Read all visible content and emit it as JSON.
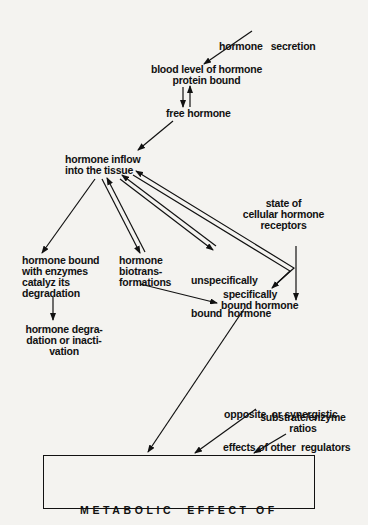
{
  "diagram": {
    "nodes": {
      "secretion": {
        "lines": [
          "hormone   secretion"
        ]
      },
      "blood_level": {
        "lines": [
          "blood level of hormone",
          "protein bound"
        ]
      },
      "free": {
        "lines": [
          "free hormone"
        ]
      },
      "inflow": {
        "lines": [
          "hormone inflow",
          "into the tissue"
        ]
      },
      "enzymes": {
        "lines": [
          "hormone bound",
          "with enzymes",
          "catalyz its",
          "degradation"
        ]
      },
      "biotrans": {
        "lines": [
          "hormone",
          "biotrans-",
          "formations"
        ]
      },
      "unspecific": {
        "lines": [
          "unspecifically",
          "bound  hormone"
        ]
      },
      "receptors": {
        "lines": [
          "state of",
          "cellular hormone",
          "receptors"
        ]
      },
      "specific": {
        "lines": [
          "specifically",
          "bound hormone"
        ]
      },
      "degradation": {
        "lines": [
          "hormone degra-",
          "dation or inacti-",
          "vation"
        ]
      },
      "regulators": {
        "lines": [
          "opposite  or synergistic",
          "effects of other  regulators"
        ]
      },
      "ratios": {
        "lines": [
          "substrate/enzyme",
          "ratios"
        ]
      },
      "effect": {
        "lines": [
          "METABOLIC  EFFECT OF",
          "HORMONE"
        ]
      }
    },
    "edges": [
      {
        "from": "secretion",
        "to": "blood_level",
        "type": "single"
      },
      {
        "from": "blood_level",
        "to": "free",
        "type": "reversible"
      },
      {
        "from": "free",
        "to": "inflow",
        "type": "single"
      },
      {
        "from": "inflow",
        "to": "enzymes",
        "type": "single"
      },
      {
        "from": "inflow",
        "to": "biotrans",
        "type": "reversible"
      },
      {
        "from": "inflow",
        "to": "unspecific",
        "type": "reversible"
      },
      {
        "from": "inflow",
        "to": "specific",
        "type": "reversible"
      },
      {
        "from": "receptors",
        "to": "specific",
        "type": "single"
      },
      {
        "from": "biotrans",
        "to": "specific",
        "type": "single"
      },
      {
        "from": "enzymes",
        "to": "degradation",
        "type": "single"
      },
      {
        "from": "specific",
        "to": "effect",
        "type": "single"
      },
      {
        "from": "regulators",
        "to": "effect",
        "type": "single"
      },
      {
        "from": "ratios",
        "to": "effect",
        "type": "single"
      }
    ]
  }
}
